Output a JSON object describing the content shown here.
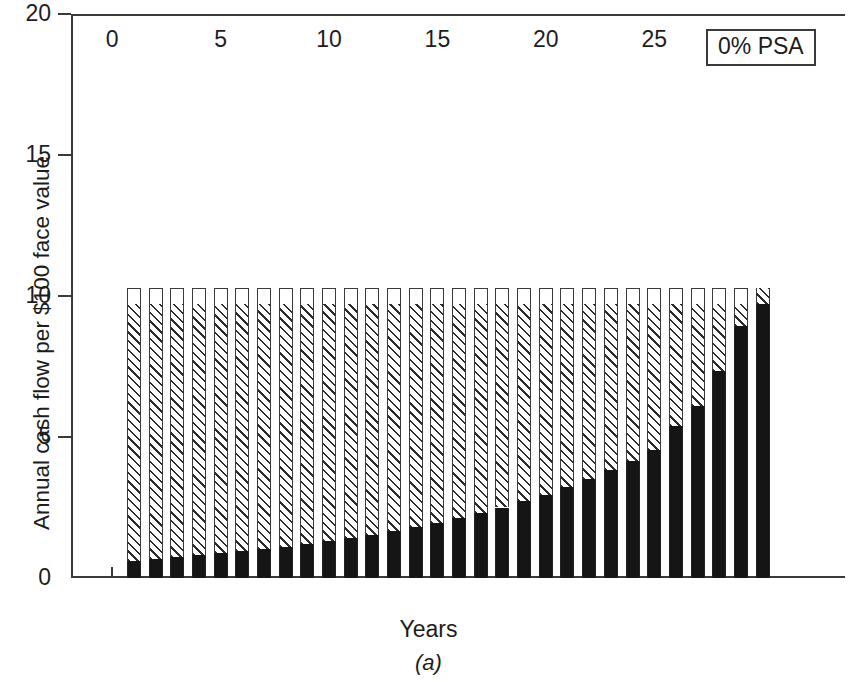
{
  "figure": {
    "caption": "(a)",
    "legend_label": "0% PSA"
  },
  "chart_data": {
    "type": "bar",
    "stacked": true,
    "title": "",
    "subtitle": "",
    "xlabel": "Years",
    "ylabel": "Annual cash flow per $100 face value",
    "xlim": [
      -1.9,
      33.8
    ],
    "ylim": [
      0,
      20
    ],
    "xticks": [
      0,
      5,
      10,
      15,
      20,
      25,
      30
    ],
    "xtick_labels": [
      "0",
      "5",
      "10",
      "15",
      "20",
      "25",
      "30"
    ],
    "yticks": [
      0,
      5,
      10,
      15,
      20
    ],
    "ytick_labels": [
      "0",
      "5",
      "10",
      "15",
      "20"
    ],
    "grid": false,
    "legend_position": "top-right",
    "annotations": [
      "0% PSA",
      "(a)"
    ],
    "categories": [
      1,
      2,
      3,
      4,
      5,
      6,
      7,
      8,
      9,
      10,
      11,
      12,
      13,
      14,
      15,
      16,
      17,
      18,
      19,
      20,
      21,
      22,
      23,
      24,
      25,
      26,
      27,
      28,
      29,
      30
    ],
    "series": [
      {
        "name": "Principal",
        "fill": "solid-black",
        "color": "#151515",
        "values": [
          0.6,
          0.68,
          0.74,
          0.8,
          0.88,
          0.95,
          1.03,
          1.1,
          1.2,
          1.3,
          1.42,
          1.52,
          1.65,
          1.8,
          1.95,
          2.12,
          2.3,
          2.5,
          2.72,
          2.95,
          3.22,
          3.5,
          3.82,
          4.15,
          4.55,
          5.4,
          6.1,
          7.35,
          8.95,
          9.7
        ]
      },
      {
        "name": "Interest",
        "fill": "diagonal-hatch",
        "color": "#2b2b2b",
        "values": [
          9.1,
          9.02,
          8.96,
          8.9,
          8.82,
          8.75,
          8.67,
          8.6,
          8.5,
          8.4,
          8.28,
          8.18,
          8.05,
          7.9,
          7.75,
          7.58,
          7.4,
          7.2,
          6.98,
          6.75,
          6.48,
          6.2,
          5.88,
          5.55,
          5.15,
          4.3,
          3.6,
          2.35,
          0.75,
          0.6
        ]
      },
      {
        "name": "Servicing",
        "fill": "white",
        "color": "#ffffff",
        "values": [
          0.6,
          0.6,
          0.6,
          0.6,
          0.6,
          0.6,
          0.6,
          0.6,
          0.6,
          0.6,
          0.6,
          0.6,
          0.6,
          0.6,
          0.6,
          0.6,
          0.6,
          0.6,
          0.6,
          0.6,
          0.6,
          0.6,
          0.6,
          0.6,
          0.6,
          0.6,
          0.6,
          0.6,
          0.6,
          0.0
        ]
      }
    ],
    "totals": [
      10.3,
      10.3,
      10.3,
      10.3,
      10.3,
      10.3,
      10.3,
      10.3,
      10.3,
      10.3,
      10.3,
      10.3,
      10.3,
      10.3,
      10.3,
      10.3,
      10.3,
      10.3,
      10.3,
      10.3,
      10.3,
      10.3,
      10.3,
      10.3,
      10.3,
      10.3,
      10.3,
      10.3,
      10.3,
      10.3
    ]
  }
}
